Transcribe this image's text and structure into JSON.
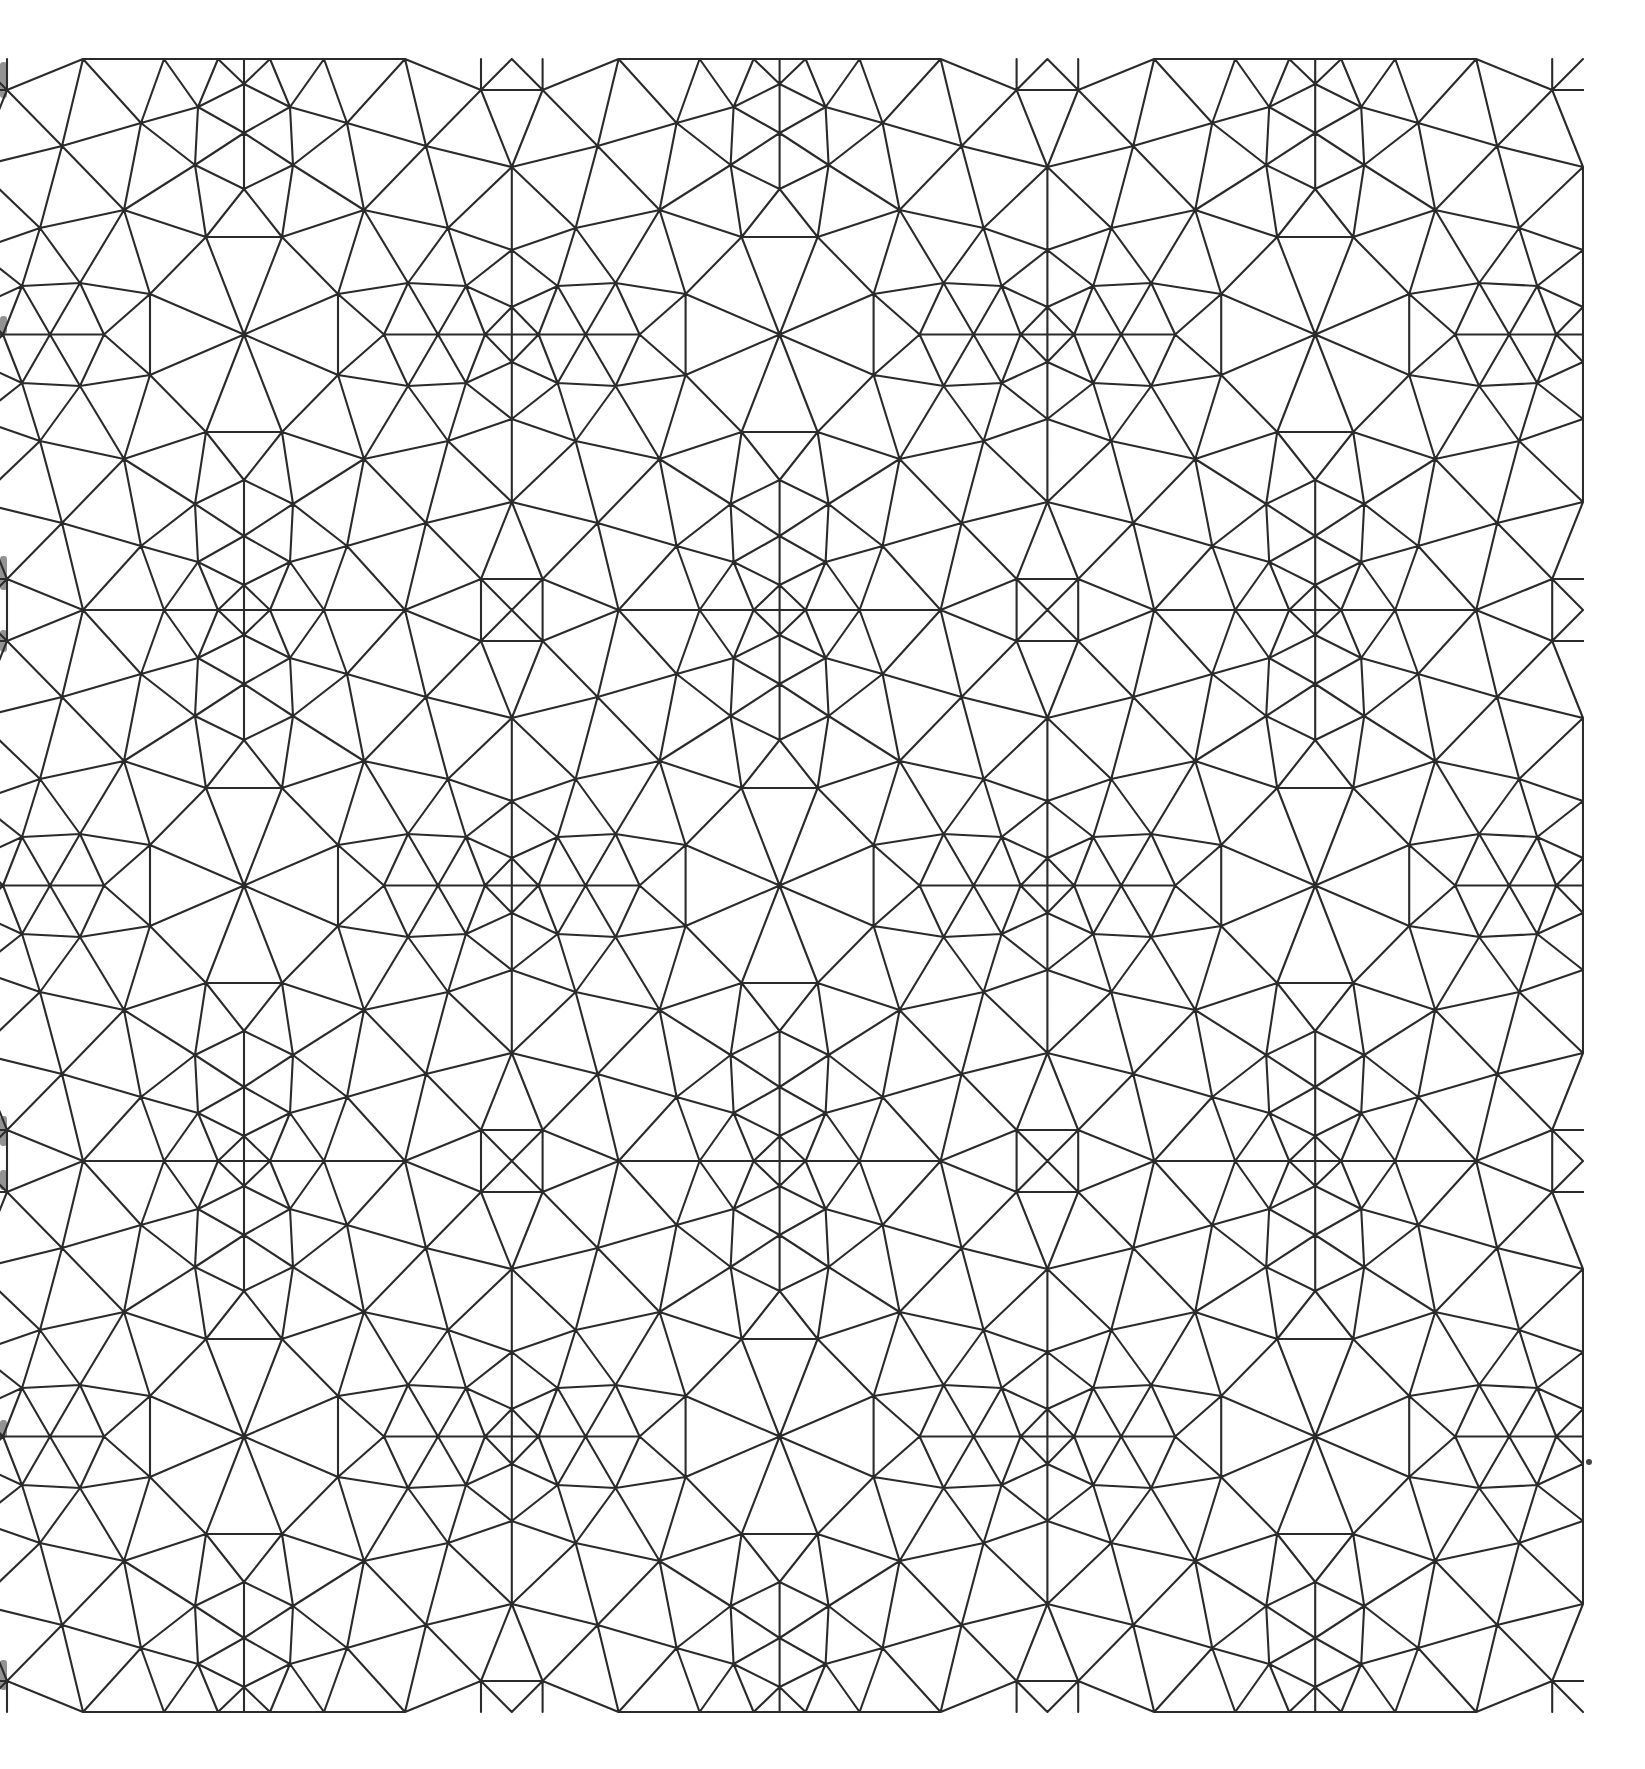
{
  "figure": {
    "title": "",
    "background": "#ffffff",
    "stroke_color": "#2b2b2b",
    "stroke_width": 2.1,
    "canvas": {
      "width": 1645,
      "height": 1769
    },
    "clip": {
      "x0": 0,
      "y0": 57,
      "x1": 1584,
      "y1": 1714
    }
  },
  "symmetry": {
    "origin_x": 244,
    "origin_y": 59,
    "cell_width": 267.8,
    "cell_height": 275.5,
    "columns_k": [
      -1,
      0,
      1,
      2,
      3,
      4
    ],
    "rows_m": [
      0,
      1,
      2,
      3,
      4,
      5
    ],
    "rule": "cell (k,m): x = X_k + u if k even else X_(k+1) - u ; y = Y_m + v if m even else Y_(m+1) - v"
  },
  "fundamental_cell": {
    "vertices": [
      [
        0,
        0
      ],
      [
        26,
        0
      ],
      [
        80,
        0
      ],
      [
        161,
        0
      ],
      [
        237,
        0
      ],
      [
        267.8,
        0
      ],
      [
        0,
        25
      ],
      [
        46,
        48
      ],
      [
        0,
        74
      ],
      [
        103,
        64
      ],
      [
        49,
        106
      ],
      [
        0,
        130
      ],
      [
        237,
        31
      ],
      [
        182,
        87
      ],
      [
        120,
        151
      ],
      [
        38,
        178
      ],
      [
        267.8,
        108
      ],
      [
        204,
        169
      ],
      [
        267.8,
        191
      ],
      [
        94,
        235
      ],
      [
        164,
        224
      ],
      [
        222,
        227
      ],
      [
        267.8,
        248
      ],
      [
        0,
        275.5
      ],
      [
        140,
        275.5
      ],
      [
        194,
        275.5
      ],
      [
        241,
        275.5
      ],
      [
        267.8,
        275.5
      ]
    ],
    "edges": [
      [
        1,
        2
      ],
      [
        2,
        3
      ],
      [
        3,
        4
      ],
      [
        4,
        13
      ],
      [
        5,
        13
      ],
      [
        6,
        13
      ],
      [
        1,
        7
      ],
      [
        7,
        2
      ],
      [
        7,
        8
      ],
      [
        7,
        9
      ],
      [
        2,
        8
      ],
      [
        3,
        8
      ],
      [
        3,
        10
      ],
      [
        4,
        10
      ],
      [
        4,
        14
      ],
      [
        13,
        14
      ],
      [
        13,
        17
      ],
      [
        8,
        10
      ],
      [
        8,
        9
      ],
      [
        8,
        11
      ],
      [
        9,
        11
      ],
      [
        9,
        12
      ],
      [
        10,
        11
      ],
      [
        10,
        14
      ],
      [
        10,
        15
      ],
      [
        11,
        15
      ],
      [
        11,
        12
      ],
      [
        11,
        16
      ],
      [
        12,
        16
      ],
      [
        14,
        15
      ],
      [
        14,
        18
      ],
      [
        14,
        17
      ],
      [
        17,
        18
      ],
      [
        17,
        19
      ],
      [
        15,
        16
      ],
      [
        15,
        18
      ],
      [
        15,
        20
      ],
      [
        15,
        21
      ],
      [
        16,
        20
      ],
      [
        16,
        24
      ],
      [
        18,
        21
      ],
      [
        18,
        22
      ],
      [
        18,
        19
      ],
      [
        19,
        22
      ],
      [
        19,
        23
      ],
      [
        21,
        22
      ],
      [
        21,
        20
      ],
      [
        21,
        25
      ],
      [
        21,
        26
      ],
      [
        22,
        23
      ],
      [
        22,
        26
      ],
      [
        22,
        27
      ],
      [
        23,
        27
      ],
      [
        23,
        28
      ],
      [
        20,
        24
      ],
      [
        20,
        25
      ],
      [
        25,
        26
      ],
      [
        26,
        27
      ],
      [
        27,
        28
      ]
    ],
    "crossing_edges": [
      {
        "a": 13,
        "b": 13,
        "mirror": "R"
      },
      {
        "a": 16,
        "b": 16,
        "mirror": "L"
      },
      {
        "a": 20,
        "b": 20,
        "mirror": "D"
      }
    ]
  },
  "artifacts": {
    "left_edge_shadows": [
      {
        "x": 2,
        "y": 62,
        "h": 36
      },
      {
        "x": 2,
        "y": 316,
        "h": 18
      },
      {
        "x": 2,
        "y": 556,
        "h": 34
      },
      {
        "x": 2,
        "y": 630,
        "h": 22
      },
      {
        "x": 2,
        "y": 1116,
        "h": 30
      },
      {
        "x": 2,
        "y": 1170,
        "h": 20
      },
      {
        "x": 2,
        "y": 1420,
        "h": 18
      },
      {
        "x": 2,
        "y": 1660,
        "h": 30
      }
    ],
    "speck": {
      "x": 1589,
      "y": 1462,
      "r": 3
    }
  }
}
